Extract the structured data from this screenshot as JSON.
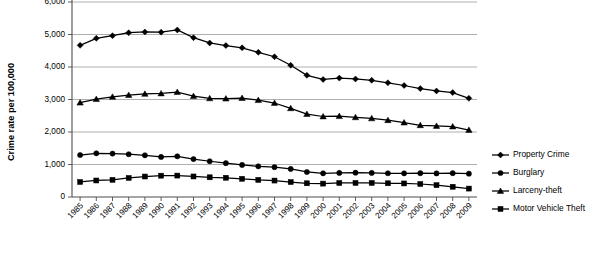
{
  "chart_data": {
    "type": "line",
    "title": "",
    "xlabel": "",
    "ylabel": "Crime rate per 100,000",
    "ylim": [
      0,
      6000
    ],
    "ytick_labels": [
      "0",
      "1,000",
      "2,000",
      "3,000",
      "4,000",
      "5,000",
      "6,000"
    ],
    "ytick_values": [
      0,
      1000,
      2000,
      3000,
      4000,
      5000,
      6000
    ],
    "ytick_interval": 1000,
    "grid": true,
    "grid_axis": "y",
    "legend_position": "right",
    "top_label_cropped": true,
    "categories": [
      "1985",
      "1986",
      "1987",
      "1988",
      "1989",
      "1990",
      "1991",
      "1992",
      "1993",
      "1994",
      "1995",
      "1996",
      "1997",
      "1998",
      "1999",
      "2000",
      "2001",
      "2002",
      "2003",
      "2004",
      "2005",
      "2006",
      "2007",
      "2008",
      "2009"
    ],
    "series": [
      {
        "name": "Property Crime",
        "marker": "diamond",
        "color": "#000000",
        "values": [
          4666,
          4881,
          4963,
          5054,
          5078,
          5073,
          5140,
          4903,
          4740,
          4660,
          4591,
          4451,
          4316,
          4053,
          3744,
          3618,
          3658,
          3631,
          3591,
          3514,
          3431,
          3335,
          3263,
          3212,
          3036
        ]
      },
      {
        "name": "Burglary",
        "marker": "circle",
        "color": "#000000",
        "values": [
          1292,
          1345,
          1335,
          1316,
          1283,
          1232,
          1252,
          1168,
          1100,
          1042,
          987,
          945,
          919,
          863,
          770,
          729,
          741,
          747,
          741,
          730,
          727,
          733,
          726,
          733,
          717
        ]
      },
      {
        "name": "Larceny-theft",
        "marker": "triangle",
        "color": "#000000",
        "values": [
          2901,
          3010,
          3081,
          3135,
          3171,
          3185,
          3229,
          3103,
          3034,
          3026,
          3043,
          2980,
          2892,
          2729,
          2551,
          2477,
          2486,
          2451,
          2417,
          2362,
          2288,
          2207,
          2185,
          2167,
          2061
        ]
      },
      {
        "name": "Motor Vehicle Theft",
        "marker": "square",
        "color": "#000000",
        "values": [
          462,
          508,
          529,
          586,
          630,
          656,
          659,
          632,
          606,
          592,
          560,
          526,
          506,
          460,
          422,
          412,
          431,
          433,
          433,
          422,
          417,
          400,
          364,
          315,
          259
        ]
      }
    ]
  }
}
